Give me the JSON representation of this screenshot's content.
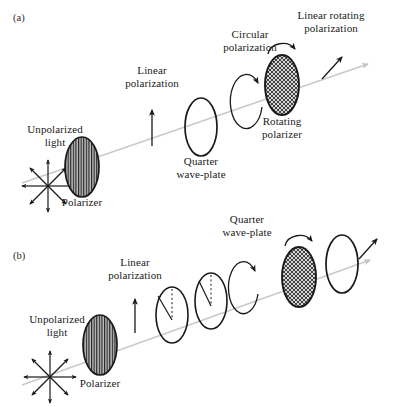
{
  "figure": {
    "type": "optical-setup-diagram",
    "background": "#ffffff",
    "ink_color": "#1a1a1a",
    "beam_color": "#c9c9c9",
    "panels": [
      {
        "tag": "(a)",
        "tag_pos": [
          14,
          18
        ],
        "beam": {
          "x1": 22,
          "y1": 183,
          "x2": 374,
          "y2": 62,
          "arrow": true
        },
        "elements": [
          {
            "name": "unpolarized-light-label",
            "kind": "label",
            "text": "Unpolarized\nlight",
            "x": 55,
            "y": 137
          },
          {
            "name": "unpolarized-starburst",
            "kind": "starburst",
            "cx": 48,
            "cy": 186,
            "r": 28,
            "rays": 8
          },
          {
            "name": "polarizer-a",
            "kind": "ellipse-vhatch",
            "cx": 82,
            "cy": 167,
            "rx": 17,
            "ry": 30
          },
          {
            "name": "polarizer-a-label",
            "kind": "label",
            "text": "Polarizer",
            "x": 82,
            "y": 203
          },
          {
            "name": "linear-polarization-label-a",
            "kind": "label",
            "text": "Linear\npolarization",
            "x": 152,
            "y": 78
          },
          {
            "name": "linear-polarization-arrow-a",
            "kind": "arrow-v",
            "x": 152,
            "y1": 146,
            "y2": 110
          },
          {
            "name": "quarter-waveplate-a",
            "kind": "ellipse-open",
            "cx": 201,
            "cy": 127,
            "rx": 16,
            "ry": 29
          },
          {
            "name": "quarter-waveplate-a-label",
            "kind": "label",
            "text": "Quarter\nwave-plate",
            "x": 201,
            "y": 162
          },
          {
            "name": "circular-polarization-label",
            "kind": "label",
            "text": "Circular\npolarization",
            "x": 250,
            "y": 42
          },
          {
            "name": "circular-polarization-loop",
            "kind": "loop",
            "cx": 250,
            "cy": 105,
            "rx": 16,
            "ry": 27
          },
          {
            "name": "rotating-polarizer-a",
            "kind": "ellipse-xhatch",
            "cx": 282,
            "cy": 85,
            "rx": 17,
            "ry": 30
          },
          {
            "name": "rotating-polarizer-a-label",
            "kind": "label",
            "text": "Rotating\npolarizer",
            "x": 282,
            "y": 122
          },
          {
            "name": "rotation-arc-a",
            "kind": "arc-arrow",
            "cx": 282,
            "cy": 49,
            "rx": 14,
            "ry": 11
          },
          {
            "name": "linear-rotating-polarization-label-a",
            "kind": "label",
            "text": "Linear rotating\npolarization",
            "x": 330,
            "y": 22
          },
          {
            "name": "linear-rotating-arrow-a",
            "kind": "arrow-tilt2",
            "x1": 320,
            "y1": 78,
            "x2": 343,
            "y2": 56
          }
        ]
      },
      {
        "tag": "(b)",
        "tag_pos": [
          14,
          256
        ],
        "beam": {
          "x1": 22,
          "y1": 385,
          "x2": 374,
          "y2": 258,
          "arrow": true
        },
        "elements": [
          {
            "name": "unpolarized-light-label",
            "kind": "label",
            "text": "Unpolarized\nlight",
            "x": 55,
            "y": 327
          },
          {
            "name": "unpolarized-starburst",
            "kind": "starburst",
            "cx": 50,
            "cy": 377,
            "r": 28,
            "rays": 8
          },
          {
            "name": "polarizer-b",
            "kind": "ellipse-vhatch",
            "cx": 100,
            "cy": 345,
            "rx": 17,
            "ry": 30
          },
          {
            "name": "polarizer-b-label",
            "kind": "label",
            "text": "Polarizer",
            "x": 100,
            "y": 384
          },
          {
            "name": "linear-polarization-label-b",
            "kind": "label",
            "text": "Linear\npolarization",
            "x": 135,
            "y": 270
          },
          {
            "name": "linear-polarization-arrow-b",
            "kind": "arrow-v",
            "x": 135,
            "y1": 333,
            "y2": 299
          },
          {
            "name": "half-waveplate",
            "kind": "ellipse-angle",
            "cx": 172,
            "cy": 315,
            "rx": 16,
            "ry": 28,
            "angle_label": "α"
          },
          {
            "name": "half-waveplate-label",
            "kind": "label",
            "text": "Half\nwave-plate",
            "x": 172,
            "y": 355
          },
          {
            "name": "quarter-waveplate-b",
            "kind": "ellipse-angle",
            "cx": 211,
            "cy": 301,
            "rx": 16,
            "ry": 28,
            "angle_label": "β"
          },
          {
            "name": "quarter-waveplate-b-label",
            "kind": "label",
            "text": "Quarter\nwave-plate",
            "x": 214,
            "y": 340
          },
          {
            "name": "elliptic-polarization-label",
            "kind": "label",
            "text": "Elliptic\npolarization",
            "x": 247,
            "y": 227
          },
          {
            "name": "elliptic-polarization-loop",
            "kind": "loop",
            "cx": 247,
            "cy": 292,
            "rx": 15,
            "ry": 26
          },
          {
            "name": "rotating-polarizer-b",
            "kind": "ellipse-xhatch",
            "cx": 299,
            "cy": 277,
            "rx": 17,
            "ry": 30
          },
          {
            "name": "rotating-polarizer-b-label",
            "kind": "label",
            "text": "Rotating\npolarizer",
            "x": 299,
            "y": 316
          },
          {
            "name": "rotation-arc-b",
            "kind": "arc-arrow",
            "cx": 299,
            "cy": 241,
            "rx": 14,
            "ry": 11
          },
          {
            "name": "dichroic-mirror",
            "kind": "ellipse-open",
            "cx": 342,
            "cy": 264,
            "rx": 16,
            "ry": 29
          },
          {
            "name": "dichroic-mirror-label",
            "kind": "label",
            "text": "Dichroic\nmirror",
            "x": 344,
            "y": 299
          },
          {
            "name": "linear-rotating-polarization-label-b",
            "kind": "label",
            "text": "Linear rotating\npolarization",
            "x": 341,
            "y": 194
          },
          {
            "name": "linear-rotating-arrow-b",
            "kind": "arrow-tilt2",
            "x1": 357,
            "y1": 258,
            "x2": 377,
            "y2": 238
          }
        ]
      }
    ]
  }
}
